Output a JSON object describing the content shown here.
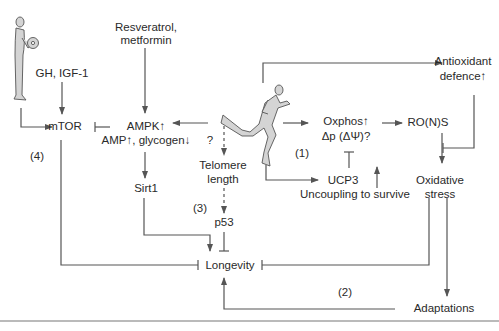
{
  "diagram": {
    "nodes": {
      "resveratrol": "Resveratrol,",
      "metformin": "metformin",
      "gh_igf": "GH, IGF-1",
      "mtor": "mTOR",
      "ampk": "AMPK↑",
      "amp_glycogen": "AMP↑, glycogen↓",
      "sirt1": "Sirt1",
      "question": "?",
      "telomere_1": "Telomere",
      "telomere_2": "length",
      "p53": "p53",
      "longevity": "Longevity",
      "oxphos": "Oxphos↑",
      "delta_p": "Δp (ΔΨ)?",
      "rons": "RO(N)S",
      "antioxidant_1": "Antioxidant",
      "antioxidant_2": "defence↑",
      "ucp3": "UCP3",
      "uncoupling": "Uncoupling to survive",
      "oxidative_1": "Oxidative",
      "oxidative_2": "stress",
      "adaptations": "Adaptations"
    },
    "labels": {
      "pathway_1": "(1)",
      "pathway_2": "(2)",
      "pathway_3": "(3)",
      "pathway_4": "(4)"
    },
    "figures": {
      "weightlifter": "resistance-exercise-figure",
      "runner": "endurance-exercise-figure"
    },
    "colors": {
      "line": "#555555",
      "figure_fill": "#d4d4d4",
      "figure_stroke": "#555555",
      "text": "#2a2a2a"
    }
  }
}
